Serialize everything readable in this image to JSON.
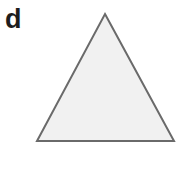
{
  "figure": {
    "panel_label": "d",
    "background_color": "#ffffff",
    "width": 184,
    "height": 169
  },
  "shape": {
    "name": "triangle",
    "type": "equilateral-triangle",
    "fill_color": "#f1f1f1",
    "stroke_color": "#6a6a6a",
    "stroke_width": 2,
    "points": "105,14 174,141 37,141",
    "vertices": [
      {
        "label": "apex",
        "x": 105,
        "y": 14
      },
      {
        "label": "bottom-right",
        "x": 174,
        "y": 141
      },
      {
        "label": "bottom-left",
        "x": 37,
        "y": 141
      }
    ]
  }
}
